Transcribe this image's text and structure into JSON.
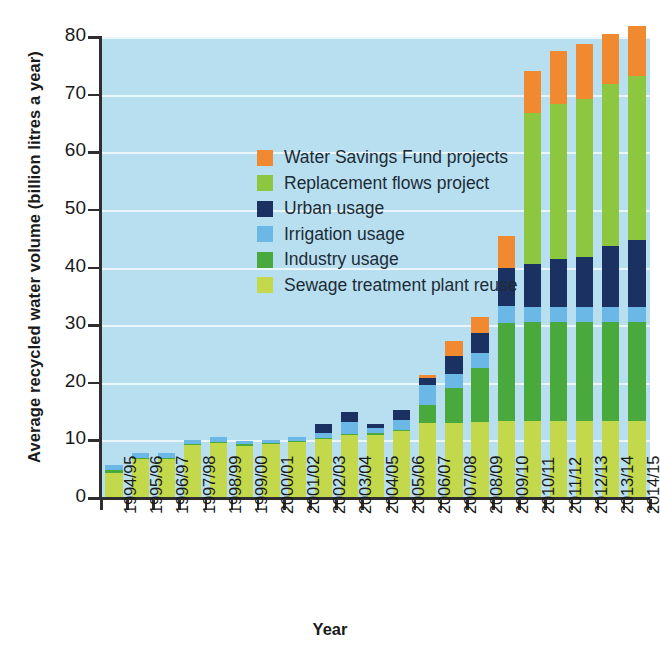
{
  "chart_data": {
    "type": "bar",
    "stacked": true,
    "title": "",
    "xlabel": "Year",
    "ylabel": "Average recycled water volume (billion litres a year)",
    "ylim": [
      0,
      80
    ],
    "yticks": [
      0,
      10,
      20,
      30,
      40,
      50,
      60,
      70,
      80
    ],
    "grid": true,
    "legend_position": "inside-top-left",
    "plot_background": "#b8dff0",
    "categories": [
      "1994/95",
      "1995/96",
      "1996/97",
      "1997/98",
      "1998/99",
      "1999/00",
      "2000/01",
      "2001/02",
      "2002/03",
      "2003/04",
      "2004/05",
      "2005/06",
      "2006/07",
      "2007/08",
      "2008/09",
      "2009/10",
      "2010/11",
      "2011/12",
      "2012/13",
      "2013/14",
      "2014/15"
    ],
    "series": [
      {
        "name": "Sewage treatment plant reuse",
        "color": "#c3d94b",
        "values": [
          4.3,
          6.8,
          6.8,
          9.2,
          9.6,
          9.1,
          9.3,
          9.7,
          10.3,
          10.9,
          11.0,
          11.6,
          13.1,
          13.1,
          13.2,
          13.3,
          13.4,
          13.4,
          13.4,
          13.4,
          13.4
        ]
      },
      {
        "name": "Industry usage",
        "color": "#4aa93c",
        "values": [
          0.5,
          0.2,
          0.2,
          0.2,
          0.2,
          0.2,
          0.2,
          0.2,
          0.2,
          0.2,
          0.2,
          0.2,
          3.0,
          6.0,
          9.4,
          17.0,
          17.2,
          17.2,
          17.2,
          17.2,
          17.2
        ]
      },
      {
        "name": "Irrigation usage",
        "color": "#6bb8e6",
        "values": [
          1.0,
          0.8,
          0.9,
          0.7,
          0.8,
          0.6,
          0.6,
          0.7,
          0.8,
          2.1,
          0.9,
          1.7,
          3.5,
          2.4,
          2.6,
          3.0,
          2.5,
          2.5,
          2.5,
          2.5,
          2.5
        ]
      },
      {
        "name": "Urban usage",
        "color": "#1b3162",
        "values": [
          0.0,
          0.0,
          0.0,
          0.0,
          0.0,
          0.0,
          0.0,
          0.0,
          1.6,
          1.8,
          0.8,
          1.8,
          1.3,
          3.1,
          3.4,
          6.6,
          7.5,
          8.3,
          8.7,
          10.6,
          11.7
        ]
      },
      {
        "name": "Replacement flows project",
        "color": "#8dc63f",
        "values": [
          0.0,
          0.0,
          0.0,
          0.0,
          0.0,
          0.0,
          0.0,
          0.0,
          0.0,
          0.0,
          0.0,
          0.0,
          0.0,
          0.0,
          0.0,
          0.0,
          26.2,
          26.9,
          27.5,
          28.1,
          28.5
        ]
      },
      {
        "name": "Water Savings Fund projects",
        "color": "#f0892f",
        "values": [
          0.0,
          0.0,
          0.0,
          0.0,
          0.0,
          0.0,
          0.0,
          0.0,
          0.0,
          0.0,
          0.0,
          0.0,
          0.5,
          2.6,
          2.8,
          5.5,
          7.3,
          9.3,
          9.5,
          8.7,
          8.6
        ]
      }
    ],
    "totals": [
      5.8,
      7.8,
      7.9,
      10.1,
      10.6,
      9.9,
      10.1,
      10.6,
      12.9,
      15.0,
      12.9,
      15.3,
      21.4,
      27.2,
      31.4,
      45.4,
      74.1,
      77.6,
      78.8,
      80.5,
      81.9
    ]
  },
  "legend": {
    "items": [
      {
        "label": "Water Savings Fund projects",
        "color": "#f0892f"
      },
      {
        "label": "Replacement flows project",
        "color": "#8dc63f"
      },
      {
        "label": "Urban usage",
        "color": "#1b3162"
      },
      {
        "label": "Irrigation usage",
        "color": "#6bb8e6"
      },
      {
        "label": "Industry usage",
        "color": "#4aa93c"
      },
      {
        "label": "Sewage treatment plant reuse",
        "color": "#c3d94b"
      }
    ]
  },
  "axes": {
    "y_title": "Average recycled water volume (billion litres a year)",
    "x_title": "Year",
    "y_tick_labels": [
      "0",
      "10",
      "20",
      "30",
      "40",
      "50",
      "60",
      "70",
      "80"
    ]
  }
}
